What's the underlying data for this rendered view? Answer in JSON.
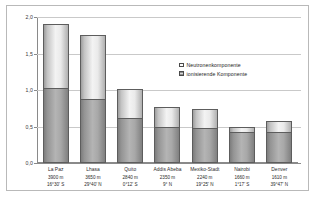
{
  "chart_data": {
    "type": "bar",
    "subtype": "stacked-column",
    "title": "",
    "xlabel": "",
    "ylabel": "effektive Jahresdosis, mSv",
    "ylim": [
      0.0,
      2.0
    ],
    "yticks": [
      "0,0",
      "0,5",
      "1,0",
      "1,5",
      "2,0"
    ],
    "ytick_values": [
      0.0,
      0.5,
      1.0,
      1.5,
      2.0
    ],
    "grid": true,
    "legend_position": "inside-top-right",
    "categories": [
      "La Paz",
      "Lhasa",
      "Quito",
      "Addis Abeba",
      "Mexiko-Stadt",
      "Nairobi",
      "Denver"
    ],
    "altitudes": [
      "3900 m",
      "3650 m",
      "2840 m",
      "2350 m",
      "2240 m",
      "1660 m",
      "1610 m"
    ],
    "latitudes": [
      "16°30' S",
      "29°40' N",
      "0°12' S",
      "9° N",
      "19°25' N",
      "1°17' S",
      "39°47' N"
    ],
    "series": [
      {
        "name": "ionisierende Komponente",
        "color": "#a8a8a8",
        "values": [
          1.03,
          0.88,
          0.62,
          0.49,
          0.48,
          0.42,
          0.42
        ]
      },
      {
        "name": "Neutronenkomponente",
        "color": "#f3f3f3",
        "values": [
          0.87,
          0.87,
          0.39,
          0.28,
          0.26,
          0.08,
          0.15
        ]
      }
    ],
    "totals": [
      1.9,
      1.75,
      1.01,
      0.77,
      0.74,
      0.5,
      0.57
    ]
  },
  "legend": {
    "items": [
      {
        "label": "Neutronenkomponente",
        "swatch": "neutron"
      },
      {
        "label": "ionisierende Komponente",
        "swatch": "ion"
      }
    ]
  }
}
